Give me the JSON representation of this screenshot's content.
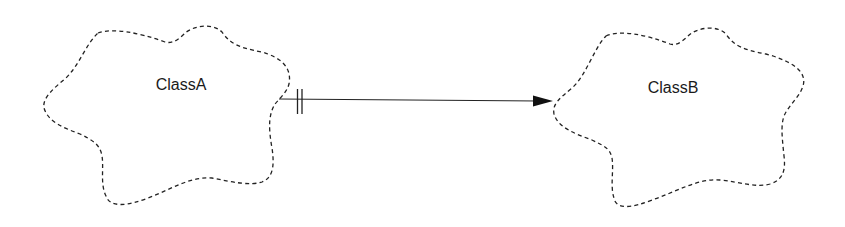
{
  "diagram": {
    "type": "class-relationship",
    "notation": "Booch class clouds",
    "nodes": [
      {
        "id": "classA",
        "label": "ClassA",
        "shape": "dashed-cloud"
      },
      {
        "id": "classB",
        "label": "ClassB",
        "shape": "dashed-cloud"
      }
    ],
    "edges": [
      {
        "from": "classA",
        "to": "classB",
        "source_adornment": "double-tick",
        "target_adornment": "filled-arrowhead",
        "line_style": "solid"
      }
    ],
    "colors": {
      "background": "#ffffff",
      "stroke": "#222222",
      "text": "#1a1a1a"
    }
  }
}
